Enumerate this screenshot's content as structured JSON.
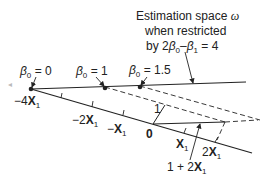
{
  "diagram": {
    "caption_lines": [
      "Estimation space ω",
      "when restricted",
      "by 2β0–β1 = 4"
    ],
    "caption": {
      "line1": "Estimation space ",
      "omega": "ω",
      "line2": "when restricted",
      "line3_prefix": "by 2",
      "beta": "β",
      "sub0": "0",
      "minus": "–",
      "sub1": "1",
      "line3_suffix": " = 4"
    },
    "points": [
      {
        "label_beta": "β",
        "label_sub": "0",
        "label_rest": " = 0"
      },
      {
        "label_beta": "β",
        "label_sub": "0",
        "label_rest": " = 1"
      },
      {
        "label_beta": "β",
        "label_sub": "0",
        "label_rest": " = 1.5"
      }
    ],
    "axis_labels": {
      "minus4x1": {
        "prefix": "−4",
        "x": "X",
        "sub": "1"
      },
      "minus2x1": {
        "prefix": "−2",
        "x": "X",
        "sub": "1"
      },
      "minusx1": {
        "prefix": "−",
        "x": "X",
        "sub": "1"
      },
      "origin": "0",
      "x1": {
        "prefix": "",
        "x": "X",
        "sub": "1"
      },
      "twox1": {
        "prefix": "2",
        "x": "X",
        "sub": "1"
      },
      "one_plus_2x1": {
        "prefix": "1 + 2",
        "x": "X",
        "sub": "1"
      },
      "unit_vector": "1"
    },
    "colors": {
      "ink": "#222222",
      "background": "#ffffff"
    }
  }
}
